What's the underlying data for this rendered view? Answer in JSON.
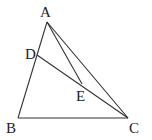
{
  "diagram": {
    "type": "triangle-geometry",
    "points": {
      "A": {
        "label": "A",
        "x": 47,
        "y": 22,
        "lx": 40,
        "ly": 17
      },
      "B": {
        "label": "B",
        "x": 18,
        "y": 118,
        "lx": 6,
        "ly": 133
      },
      "C": {
        "label": "C",
        "x": 128,
        "y": 118,
        "lx": 129,
        "ly": 133
      },
      "D": {
        "label": "D",
        "x": 37,
        "y": 55,
        "lx": 25,
        "ly": 59
      },
      "E": {
        "label": "E",
        "x": 82,
        "y": 84,
        "lx": 76,
        "ly": 101
      }
    },
    "segments": [
      [
        "A",
        "B"
      ],
      [
        "B",
        "C"
      ],
      [
        "A",
        "C"
      ],
      [
        "A",
        "E"
      ],
      [
        "D",
        "C"
      ]
    ],
    "colors": {
      "stroke": "#333333",
      "text": "#222222",
      "background": "#ffffff"
    }
  }
}
